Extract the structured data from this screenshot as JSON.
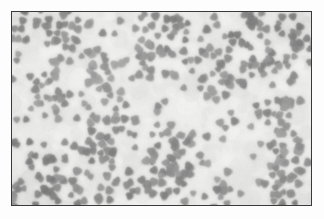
{
  "figure": {
    "kind": "micrograph",
    "modality": "grayscale electron micrograph",
    "caption": "",
    "scale_bar_text": "",
    "annotation_text": "",
    "border_color": "#3a3a3a",
    "background_color": "#e9e9e7",
    "particle_color": "#8a8a8a",
    "particle_dark_color": "#6f6f6f",
    "matrix_light_color": "#f2f2f0",
    "page_background": "#ffffff"
  },
  "render": {
    "frame": {
      "x": 11,
      "y": 11,
      "width": 301,
      "height": 195
    },
    "particle_count": 560,
    "particle_radius_min": 3.6,
    "particle_radius_max": 5.4,
    "cluster_count": 78,
    "cluster_spread": 11.5,
    "blur_radius": 1.15,
    "seed": 20240817,
    "grain_strength": 26
  }
}
